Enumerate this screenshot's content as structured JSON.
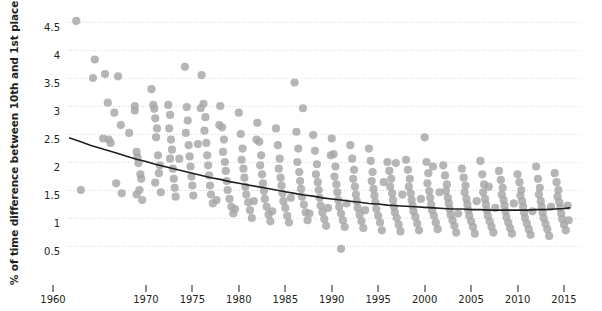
{
  "chart_data": {
    "type": "scatter",
    "title": "",
    "xlabel": "",
    "ylabel": "% of time difference between 10th and 1st place",
    "xlim": [
      1960,
      2016
    ],
    "ylim": [
      0.3,
      4.7
    ],
    "grid": true,
    "legend": null,
    "point_color": "#a6a6a6",
    "trend_color": "#231f20",
    "gridline_color": "#d8d8e0",
    "x_ticks": [
      1960,
      1970,
      1975,
      1980,
      1985,
      1990,
      1995,
      2000,
      2005,
      2010,
      2015
    ],
    "x_tick_labels": [
      "1960",
      "1970",
      "1975",
      "1980",
      "1985",
      "1990",
      "1995",
      "2000",
      "2005",
      "2010",
      "2015"
    ],
    "y_ticks": [
      0.5,
      1,
      1.5,
      2,
      2.5,
      3,
      3.5,
      4,
      4.5
    ],
    "y_tick_labels": [
      "0.5",
      "1",
      "1.5",
      "2",
      "2.5",
      "3",
      "3.5",
      "4",
      "4.5"
    ],
    "trend_line": [
      [
        1961.8,
        2.43
      ],
      [
        1963,
        2.36
      ],
      [
        1964,
        2.3
      ],
      [
        1965,
        2.25
      ],
      [
        1966,
        2.2
      ],
      [
        1967,
        2.15
      ],
      [
        1968,
        2.1
      ],
      [
        1969,
        2.05
      ],
      [
        1970,
        2.01
      ],
      [
        1971,
        1.96
      ],
      [
        1972,
        1.92
      ],
      [
        1973,
        1.88
      ],
      [
        1974,
        1.84
      ],
      [
        1975,
        1.8
      ],
      [
        1976,
        1.76
      ],
      [
        1977,
        1.72
      ],
      [
        1978,
        1.69
      ],
      [
        1979,
        1.65
      ],
      [
        1980,
        1.62
      ],
      [
        1981,
        1.59
      ],
      [
        1982,
        1.56
      ],
      [
        1983,
        1.53
      ],
      [
        1984,
        1.5
      ],
      [
        1985,
        1.47
      ],
      [
        1986,
        1.44
      ],
      [
        1987,
        1.41
      ],
      [
        1988,
        1.39
      ],
      [
        1989,
        1.36
      ],
      [
        1990,
        1.34
      ],
      [
        1991,
        1.32
      ],
      [
        1992,
        1.3
      ],
      [
        1993,
        1.28
      ],
      [
        1994,
        1.26
      ],
      [
        1995,
        1.25
      ],
      [
        1996,
        1.23
      ],
      [
        1997,
        1.22
      ],
      [
        1998,
        1.21
      ],
      [
        1999,
        1.2
      ],
      [
        2000,
        1.19
      ],
      [
        2001,
        1.18
      ],
      [
        2002,
        1.17
      ],
      [
        2003,
        1.16
      ],
      [
        2004,
        1.16
      ],
      [
        2005,
        1.15
      ],
      [
        2006,
        1.15
      ],
      [
        2007,
        1.14
      ],
      [
        2008,
        1.14
      ],
      [
        2009,
        1.14
      ],
      [
        2010,
        1.14
      ],
      [
        2011,
        1.14
      ],
      [
        2012,
        1.15
      ],
      [
        2013,
        1.15
      ],
      [
        2014,
        1.16
      ],
      [
        2015,
        1.17
      ],
      [
        2015.6,
        1.18
      ]
    ],
    "points": [
      [
        1962.5,
        4.52
      ],
      [
        1964.5,
        3.83
      ],
      [
        1964.3,
        3.5
      ],
      [
        1965.6,
        3.57
      ],
      [
        1967.0,
        3.53
      ],
      [
        1965.9,
        3.06
      ],
      [
        1966.6,
        2.88
      ],
      [
        1967.3,
        2.66
      ],
      [
        1968.2,
        2.52
      ],
      [
        1963.0,
        1.5
      ],
      [
        1965.4,
        2.42
      ],
      [
        1966.0,
        2.4
      ],
      [
        1966.2,
        2.34
      ],
      [
        1966.8,
        1.62
      ],
      [
        1967.4,
        1.44
      ],
      [
        1968.8,
        3.0
      ],
      [
        1968.8,
        2.92
      ],
      [
        1969.0,
        2.18
      ],
      [
        1969.1,
        2.08
      ],
      [
        1969.2,
        1.98
      ],
      [
        1969.4,
        1.78
      ],
      [
        1969.5,
        1.7
      ],
      [
        1969.3,
        1.5
      ],
      [
        1969.0,
        1.42
      ],
      [
        1969.6,
        1.32
      ],
      [
        1970.6,
        3.3
      ],
      [
        1970.8,
        3.02
      ],
      [
        1970.9,
        2.95
      ],
      [
        1971.0,
        2.78
      ],
      [
        1971.2,
        2.6
      ],
      [
        1971.1,
        2.44
      ],
      [
        1971.3,
        2.12
      ],
      [
        1971.5,
        1.94
      ],
      [
        1971.4,
        1.8
      ],
      [
        1971.0,
        1.63
      ],
      [
        1971.6,
        1.46
      ],
      [
        1972.4,
        3.02
      ],
      [
        1972.6,
        2.84
      ],
      [
        1972.5,
        2.6
      ],
      [
        1972.7,
        2.4
      ],
      [
        1972.8,
        2.22
      ],
      [
        1972.6,
        2.06
      ],
      [
        1972.9,
        1.88
      ],
      [
        1973.0,
        1.7
      ],
      [
        1973.1,
        1.54
      ],
      [
        1973.2,
        1.38
      ],
      [
        1974.2,
        3.7
      ],
      [
        1974.4,
        2.98
      ],
      [
        1974.5,
        2.74
      ],
      [
        1974.3,
        2.52
      ],
      [
        1974.6,
        2.3
      ],
      [
        1974.7,
        2.1
      ],
      [
        1974.8,
        1.92
      ],
      [
        1974.9,
        1.74
      ],
      [
        1975.0,
        1.58
      ],
      [
        1975.1,
        1.4
      ],
      [
        1976.0,
        3.55
      ],
      [
        1976.2,
        3.04
      ],
      [
        1976.4,
        2.8
      ],
      [
        1976.3,
        2.56
      ],
      [
        1976.5,
        2.34
      ],
      [
        1976.6,
        2.12
      ],
      [
        1976.7,
        1.94
      ],
      [
        1976.8,
        1.76
      ],
      [
        1976.9,
        1.58
      ],
      [
        1977.0,
        1.42
      ],
      [
        1977.2,
        1.26
      ],
      [
        1978.0,
        3.0
      ],
      [
        1978.2,
        2.62
      ],
      [
        1978.4,
        2.4
      ],
      [
        1978.3,
        2.18
      ],
      [
        1978.5,
        2.0
      ],
      [
        1978.6,
        1.84
      ],
      [
        1978.7,
        1.66
      ],
      [
        1978.8,
        1.5
      ],
      [
        1979.0,
        1.34
      ],
      [
        1979.2,
        1.2
      ],
      [
        1979.4,
        1.08
      ],
      [
        1980.0,
        2.88
      ],
      [
        1980.2,
        2.5
      ],
      [
        1980.4,
        2.24
      ],
      [
        1980.3,
        2.04
      ],
      [
        1980.5,
        1.88
      ],
      [
        1980.6,
        1.72
      ],
      [
        1980.7,
        1.56
      ],
      [
        1980.8,
        1.42
      ],
      [
        1981.0,
        1.28
      ],
      [
        1981.2,
        1.14
      ],
      [
        1981.4,
        1.0
      ],
      [
        1982.0,
        2.7
      ],
      [
        1982.2,
        2.36
      ],
      [
        1982.4,
        2.12
      ],
      [
        1982.3,
        1.94
      ],
      [
        1982.5,
        1.78
      ],
      [
        1982.6,
        1.62
      ],
      [
        1982.7,
        1.48
      ],
      [
        1982.8,
        1.34
      ],
      [
        1983.0,
        1.2
      ],
      [
        1983.2,
        1.06
      ],
      [
        1983.4,
        0.94
      ],
      [
        1984.0,
        2.6
      ],
      [
        1984.2,
        2.3
      ],
      [
        1984.4,
        2.06
      ],
      [
        1984.3,
        1.88
      ],
      [
        1984.5,
        1.72
      ],
      [
        1984.6,
        1.58
      ],
      [
        1984.7,
        1.44
      ],
      [
        1984.8,
        1.3
      ],
      [
        1985.0,
        1.18
      ],
      [
        1985.2,
        1.04
      ],
      [
        1985.4,
        0.92
      ],
      [
        1986.0,
        3.42
      ],
      [
        1986.2,
        2.54
      ],
      [
        1986.4,
        2.24
      ],
      [
        1986.3,
        2.0
      ],
      [
        1986.5,
        1.82
      ],
      [
        1986.6,
        1.66
      ],
      [
        1986.7,
        1.52
      ],
      [
        1986.8,
        1.38
      ],
      [
        1987.0,
        1.24
      ],
      [
        1987.2,
        1.1
      ],
      [
        1987.4,
        0.96
      ],
      [
        1988.0,
        2.48
      ],
      [
        1988.2,
        2.2
      ],
      [
        1988.4,
        1.96
      ],
      [
        1988.3,
        1.78
      ],
      [
        1988.5,
        1.64
      ],
      [
        1988.6,
        1.5
      ],
      [
        1988.7,
        1.36
      ],
      [
        1988.8,
        1.22
      ],
      [
        1989.0,
        1.1
      ],
      [
        1989.2,
        0.98
      ],
      [
        1989.4,
        0.86
      ],
      [
        1990.0,
        2.42
      ],
      [
        1990.2,
        2.14
      ],
      [
        1990.4,
        1.92
      ],
      [
        1990.3,
        1.74
      ],
      [
        1990.5,
        1.6
      ],
      [
        1990.6,
        1.46
      ],
      [
        1990.7,
        1.32
      ],
      [
        1990.8,
        1.2
      ],
      [
        1991.0,
        1.08
      ],
      [
        1991.2,
        0.96
      ],
      [
        1991.4,
        0.84
      ],
      [
        1991.0,
        0.45
      ],
      [
        1992.0,
        2.3
      ],
      [
        1992.2,
        2.06
      ],
      [
        1992.4,
        1.86
      ],
      [
        1992.3,
        1.7
      ],
      [
        1992.5,
        1.56
      ],
      [
        1992.6,
        1.42
      ],
      [
        1992.7,
        1.3
      ],
      [
        1992.8,
        1.18
      ],
      [
        1993.0,
        1.06
      ],
      [
        1993.2,
        0.94
      ],
      [
        1993.4,
        0.82
      ],
      [
        1994.0,
        2.24
      ],
      [
        1994.2,
        2.02
      ],
      [
        1994.4,
        1.82
      ],
      [
        1994.3,
        1.66
      ],
      [
        1994.5,
        1.52
      ],
      [
        1994.6,
        1.4
      ],
      [
        1994.7,
        1.28
      ],
      [
        1994.8,
        1.16
      ],
      [
        1995.0,
        1.04
      ],
      [
        1995.2,
        0.92
      ],
      [
        1995.4,
        0.78
      ],
      [
        1996.0,
        2.0
      ],
      [
        1996.2,
        1.84
      ],
      [
        1996.4,
        1.7
      ],
      [
        1996.3,
        1.56
      ],
      [
        1996.5,
        1.44
      ],
      [
        1996.6,
        1.32
      ],
      [
        1996.7,
        1.2
      ],
      [
        1996.8,
        1.1
      ],
      [
        1997.0,
        1.0
      ],
      [
        1997.2,
        0.88
      ],
      [
        1997.4,
        0.76
      ],
      [
        1998.0,
        2.04
      ],
      [
        1998.2,
        1.86
      ],
      [
        1998.4,
        1.7
      ],
      [
        1998.3,
        1.56
      ],
      [
        1998.5,
        1.44
      ],
      [
        1998.6,
        1.32
      ],
      [
        1998.7,
        1.22
      ],
      [
        1998.8,
        1.12
      ],
      [
        1999.0,
        1.02
      ],
      [
        1999.2,
        0.9
      ],
      [
        1999.4,
        0.78
      ],
      [
        2000.0,
        2.44
      ],
      [
        2000.2,
        2.0
      ],
      [
        2000.4,
        1.8
      ],
      [
        2000.3,
        1.62
      ],
      [
        2000.5,
        1.48
      ],
      [
        2000.6,
        1.36
      ],
      [
        2000.7,
        1.24
      ],
      [
        2000.8,
        1.14
      ],
      [
        2001.0,
        1.04
      ],
      [
        2001.2,
        0.92
      ],
      [
        2001.4,
        0.8
      ],
      [
        2002.0,
        1.94
      ],
      [
        2002.2,
        1.76
      ],
      [
        2002.4,
        1.6
      ],
      [
        2002.3,
        1.48
      ],
      [
        2002.5,
        1.36
      ],
      [
        2002.6,
        1.26
      ],
      [
        2002.7,
        1.16
      ],
      [
        2002.8,
        1.06
      ],
      [
        2003.0,
        0.96
      ],
      [
        2003.2,
        0.86
      ],
      [
        2003.4,
        0.74
      ],
      [
        2004.0,
        1.88
      ],
      [
        2004.2,
        1.72
      ],
      [
        2004.4,
        1.58
      ],
      [
        2004.3,
        1.46
      ],
      [
        2004.5,
        1.34
      ],
      [
        2004.6,
        1.24
      ],
      [
        2004.7,
        1.14
      ],
      [
        2004.8,
        1.04
      ],
      [
        2005.0,
        0.94
      ],
      [
        2005.2,
        0.84
      ],
      [
        2005.4,
        0.72
      ],
      [
        2006.0,
        2.02
      ],
      [
        2006.2,
        1.78
      ],
      [
        2006.4,
        1.6
      ],
      [
        2006.3,
        1.46
      ],
      [
        2006.5,
        1.34
      ],
      [
        2006.6,
        1.24
      ],
      [
        2006.7,
        1.14
      ],
      [
        2006.8,
        1.04
      ],
      [
        2007.0,
        0.94
      ],
      [
        2007.2,
        0.84
      ],
      [
        2007.4,
        0.74
      ],
      [
        2008.0,
        1.84
      ],
      [
        2008.2,
        1.68
      ],
      [
        2008.4,
        1.54
      ],
      [
        2008.3,
        1.42
      ],
      [
        2008.5,
        1.32
      ],
      [
        2008.6,
        1.22
      ],
      [
        2008.7,
        1.12
      ],
      [
        2008.8,
        1.02
      ],
      [
        2009.0,
        0.92
      ],
      [
        2009.2,
        0.82
      ],
      [
        2009.4,
        0.72
      ],
      [
        2010.0,
        1.78
      ],
      [
        2010.2,
        1.64
      ],
      [
        2010.4,
        1.5
      ],
      [
        2010.3,
        1.4
      ],
      [
        2010.5,
        1.3
      ],
      [
        2010.6,
        1.2
      ],
      [
        2010.7,
        1.1
      ],
      [
        2010.8,
        1.0
      ],
      [
        2011.0,
        0.9
      ],
      [
        2011.2,
        0.8
      ],
      [
        2011.4,
        0.7
      ],
      [
        2012.0,
        1.92
      ],
      [
        2012.2,
        1.7
      ],
      [
        2012.4,
        1.54
      ],
      [
        2012.3,
        1.42
      ],
      [
        2012.5,
        1.3
      ],
      [
        2012.6,
        1.2
      ],
      [
        2012.7,
        1.1
      ],
      [
        2012.8,
        1.0
      ],
      [
        2013.0,
        0.9
      ],
      [
        2013.2,
        0.8
      ],
      [
        2013.4,
        0.68
      ],
      [
        2014.0,
        1.8
      ],
      [
        2014.2,
        1.64
      ],
      [
        2014.4,
        1.5
      ],
      [
        2014.3,
        1.38
      ],
      [
        2014.5,
        1.28
      ],
      [
        2014.6,
        1.18
      ],
      [
        2014.7,
        1.08
      ],
      [
        2014.8,
        0.98
      ],
      [
        2015.0,
        0.88
      ],
      [
        2015.2,
        0.78
      ],
      [
        2015.4,
        1.22
      ],
      [
        1973.6,
        2.06
      ],
      [
        1975.6,
        2.32
      ],
      [
        1977.6,
        1.32
      ],
      [
        1979.6,
        1.16
      ],
      [
        1981.6,
        1.3
      ],
      [
        1983.6,
        1.12
      ],
      [
        1985.6,
        1.36
      ],
      [
        1987.6,
        1.08
      ],
      [
        1989.6,
        1.18
      ],
      [
        1991.6,
        1.26
      ],
      [
        1993.6,
        1.14
      ],
      [
        1995.6,
        1.64
      ],
      [
        1997.6,
        1.42
      ],
      [
        1999.6,
        1.34
      ],
      [
        2001.6,
        1.46
      ],
      [
        2003.6,
        1.08
      ],
      [
        2005.6,
        1.3
      ],
      [
        2007.6,
        1.18
      ],
      [
        2009.6,
        1.26
      ],
      [
        2011.6,
        1.12
      ],
      [
        2013.6,
        1.2
      ],
      [
        2015.5,
        0.96
      ],
      [
        1986.9,
        2.96
      ],
      [
        1996.9,
        1.98
      ],
      [
        2000.9,
        1.92
      ],
      [
        2006.9,
        1.56
      ],
      [
        1975.9,
        2.96
      ],
      [
        1977.9,
        2.66
      ],
      [
        1981.9,
        2.4
      ],
      [
        1989.9,
        2.12
      ]
    ]
  }
}
